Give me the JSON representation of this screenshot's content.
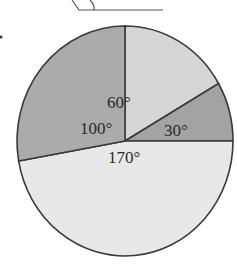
{
  "chart_data": {
    "type": "pie",
    "title": "",
    "slices": [
      {
        "label": "60°",
        "value": 60,
        "color": "#d6d6d6"
      },
      {
        "label": "30°",
        "value": 30,
        "color": "#a3a3a3"
      },
      {
        "label": "170°",
        "value": 170,
        "color": "#e8e8e8"
      },
      {
        "label": "100°",
        "value": 100,
        "color": "#ababab"
      }
    ],
    "start_angle_deg": 90,
    "direction": "clockwise",
    "unit": "degrees"
  },
  "labels": {
    "s60": "60°",
    "s30": "30°",
    "s170": "170°",
    "s100": "100°"
  }
}
